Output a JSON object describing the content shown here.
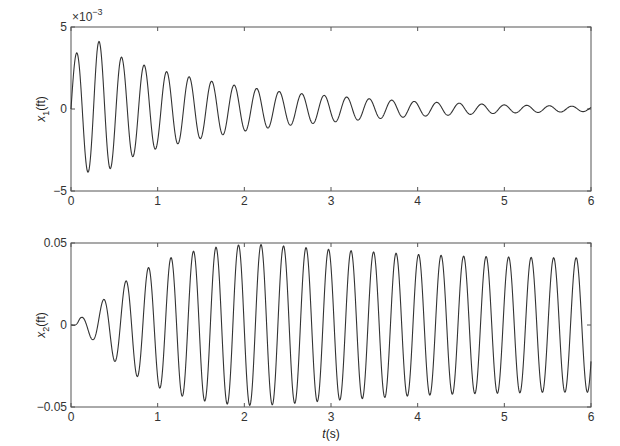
{
  "chart_data": [
    {
      "type": "line",
      "id": "x1",
      "title": "",
      "xlabel": "",
      "ylabel": "x1(ft)",
      "ylabel_main": "x",
      "ylabel_sub": "1",
      "ylabel_unit": "(ft)",
      "exponent_label": "×10",
      "exponent_power": "−3",
      "xlim": [
        0,
        6
      ],
      "ylim": [
        -0.005,
        0.005
      ],
      "xticks": [
        0,
        1,
        2,
        3,
        4,
        5,
        6
      ],
      "xtick_labels": [
        "0",
        "1",
        "2",
        "3",
        "4",
        "5",
        "6"
      ],
      "yticks": [
        -0.005,
        0,
        0.005
      ],
      "ytick_labels": [
        "−5",
        "0",
        "5"
      ],
      "grid": false,
      "series": [
        {
          "name": "x1",
          "frequency_hz": 3.85,
          "phase_rad": 0.0,
          "envelope_t": [
            0,
            0.12,
            0.3,
            0.6,
            1.0,
            1.5,
            2.0,
            2.5,
            3.0,
            3.5,
            4.0,
            4.5,
            5.0,
            5.5,
            6.0
          ],
          "envelope_amp": [
            0.0032,
            0.0036,
            0.0042,
            0.0031,
            0.0024,
            0.0018,
            0.00135,
            0.001,
            0.0008,
            0.0006,
            0.00045,
            0.00035,
            0.00025,
            0.0002,
            0.00015
          ]
        }
      ]
    },
    {
      "type": "line",
      "id": "x2",
      "title": "",
      "xlabel": "t(s)",
      "xlabel_main": "t",
      "xlabel_unit": "(s)",
      "ylabel": "x2(ft)",
      "ylabel_main": "x",
      "ylabel_sub": "2",
      "ylabel_unit": "(ft)",
      "xlim": [
        0,
        6
      ],
      "ylim": [
        -0.05,
        0.05
      ],
      "xticks": [
        0,
        1,
        2,
        3,
        4,
        5,
        6
      ],
      "xtick_labels": [
        "0",
        "1",
        "2",
        "3",
        "4",
        "5",
        "6"
      ],
      "yticks": [
        -0.05,
        0,
        0.05
      ],
      "ytick_labels": [
        "−0.05",
        "0",
        "0.05"
      ],
      "grid": false,
      "series": [
        {
          "name": "x2",
          "frequency_hz": 3.85,
          "phase_rad": -1.2,
          "envelope_t": [
            0,
            0.1,
            0.25,
            0.5,
            0.75,
            1.0,
            1.25,
            1.5,
            1.75,
            2.0,
            2.25,
            2.5,
            3.0,
            3.5,
            4.0,
            4.5,
            5.0,
            5.5,
            6.0
          ],
          "envelope_amp": [
            0.0,
            0.004,
            0.009,
            0.022,
            0.031,
            0.038,
            0.043,
            0.046,
            0.048,
            0.049,
            0.049,
            0.048,
            0.046,
            0.0445,
            0.043,
            0.042,
            0.0415,
            0.041,
            0.041
          ]
        }
      ]
    }
  ]
}
